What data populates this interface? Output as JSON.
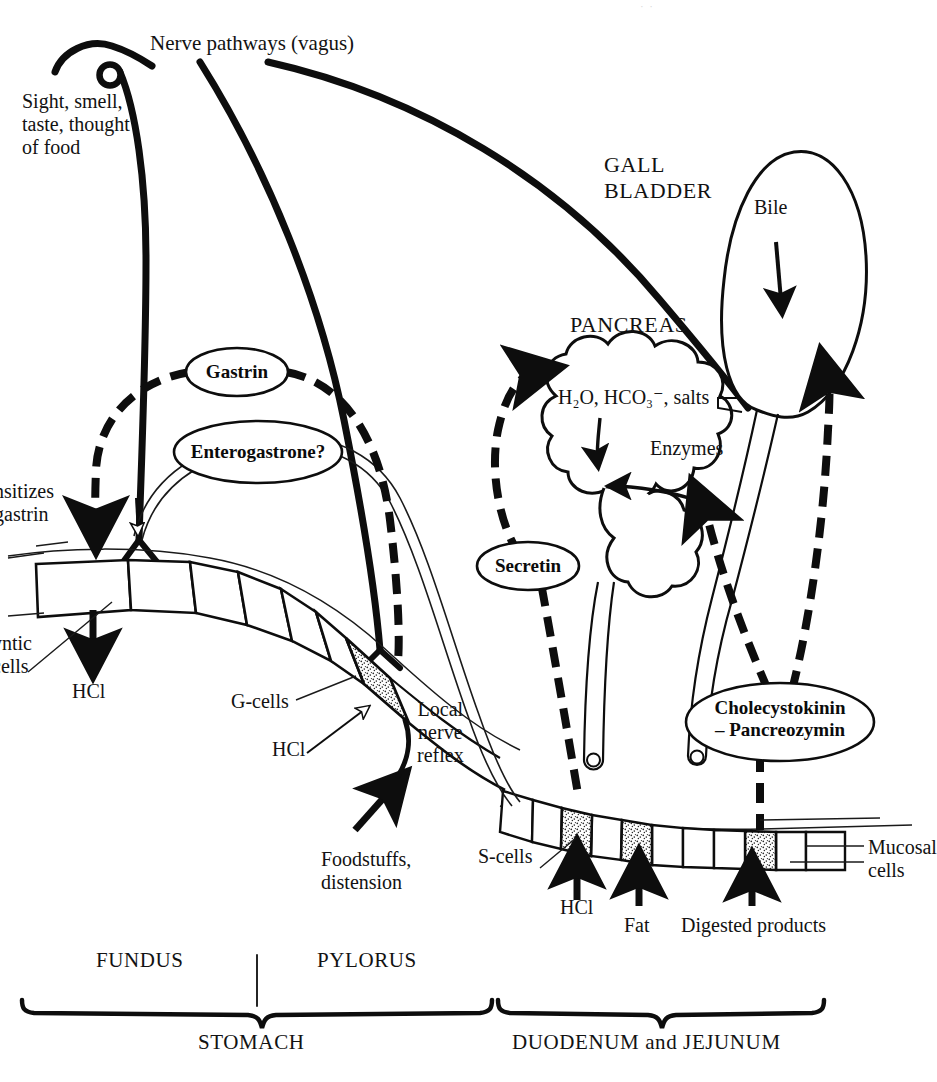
{
  "figure": {
    "title_caption": "Control of gastric, pancreatic and biliary secretion",
    "page_header_faint": "·  ·"
  },
  "labels": {
    "nerve_pathways": "Nerve pathways (vagus)",
    "sight_smell": "Sight, smell,\ntaste, thought\nof food",
    "sensitizes_gastrin": "nsitizes\ngastrin",
    "oxyntic_cells": "yntic\ncells",
    "hcl_stomach": "HCl",
    "g_cells": "G-cells",
    "hcl_gcells": "HCl",
    "local_nerve_reflex": "Local\nnerve\nreflex",
    "foodstuffs": "Foodstuffs,\ndistension",
    "s_cells": "S-cells",
    "hcl_scells": "HCl",
    "fat": "Fat",
    "digested_products": "Digested products",
    "mucosal_cells": "Mucosal\ncells",
    "gall_bladder": "GALL\nBLADDER",
    "bile": "Bile",
    "pancreas": "PANCREAS",
    "pancreas_secretion": "H₂O, HCO₃⁻, salts",
    "enzymes": "Enzymes",
    "fundus": "FUNDUS",
    "pylorus": "PYLORUS",
    "stomach": "STOMACH",
    "duodenum_jejunum": "DUODENUM and JEJUNUM"
  },
  "hormones": [
    {
      "id": "gastrin",
      "label": "Gastrin"
    },
    {
      "id": "enterogastrone",
      "label": "Enterogastrone?"
    },
    {
      "id": "secretin",
      "label": "Secretin"
    },
    {
      "id": "cck",
      "label": "Cholecystokinin\n– Pancreozymin"
    }
  ],
  "colors": {
    "ink": "#0d0d0d",
    "paper": "#ffffff",
    "stipple": "#2b2b2b",
    "thin_line": "#1a1a1a"
  },
  "legend_hints": {
    "solid_thick_line": "nerve pathway",
    "dashed_thick_line": "hormonal (bloodstream) pathway",
    "open_white_arrow": "inhibition",
    "thin_double_line": "duct"
  }
}
